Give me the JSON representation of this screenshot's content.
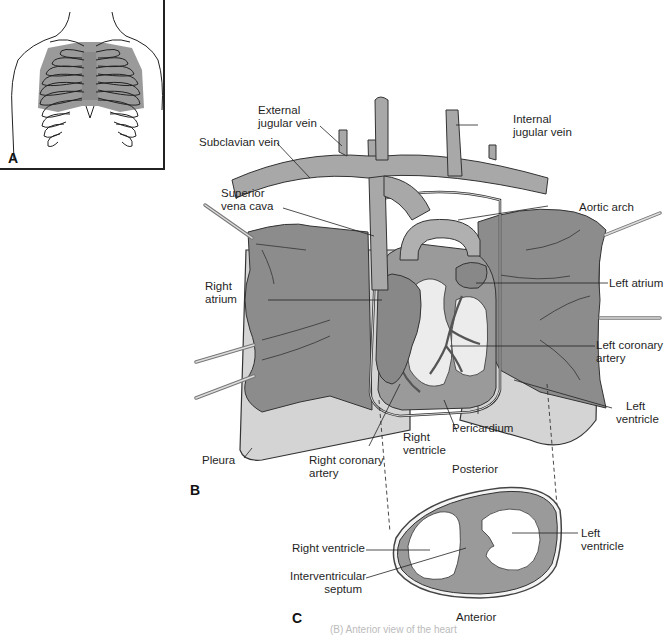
{
  "figure": {
    "panels": [
      {
        "id": "A",
        "letter": "A",
        "description": "Thorax outline with rib cage and shaded heart/lung area"
      },
      {
        "id": "B",
        "letter": "B",
        "description": "Anterior view of the heart within the thorax"
      },
      {
        "id": "C",
        "letter": "C",
        "description": "Transverse section of the ventricles"
      }
    ],
    "panel_b_labels": {
      "external_jugular_vein": "External\njugular vein",
      "external_jugular_vein_l1": "External",
      "external_jugular_vein_l2": "jugular vein",
      "internal_jugular_vein_l1": "Internal",
      "internal_jugular_vein_l2": "jugular vein",
      "subclavian_vein": "Subclavian vein",
      "superior_vena_cava_l1": "Superior",
      "superior_vena_cava_l2": "vena cava",
      "aortic_arch": "Aortic arch",
      "right_atrium_l1": "Right",
      "right_atrium_l2": "atrium",
      "left_atrium": "Left atrium",
      "left_coronary_artery_l1": "Left coronary",
      "left_coronary_artery_l2": "artery",
      "left_ventricle_l1": "Left",
      "left_ventricle_l2": "ventricle",
      "pericardium": "Pericardium",
      "right_ventricle_l1": "Right",
      "right_ventricle_l2": "ventricle",
      "pleura": "Pleura",
      "right_coronary_artery_l1": "Right coronary",
      "right_coronary_artery_l2": "artery"
    },
    "panel_c_labels": {
      "posterior": "Posterior",
      "anterior": "Anterior",
      "right_ventricle": "Right ventricle",
      "left_ventricle_l1": "Left",
      "left_ventricle_l2": "ventricle",
      "interventricular_septum_l1": "Interventricular",
      "interventricular_septum_l2": "septum"
    },
    "caption_fragment": "(B) Anterior view of the heart",
    "colors": {
      "lung": "#8c8c8c",
      "heart": "#9a9a9a",
      "vessel": "#a8a8a8",
      "pleura": "#d4d4d4",
      "coronary_fat": "#ececec",
      "outline": "#2a2a2a",
      "panel_a_shade": "#9a9a9a"
    }
  }
}
